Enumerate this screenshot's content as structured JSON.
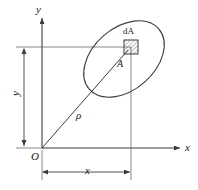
{
  "figure": {
    "type": "engineering-diagram",
    "background_color": "#ffffff",
    "line_color": "#3c3c3c",
    "text_color": "#1a1a1a",
    "labels": {
      "y_axis": "y",
      "x_axis": "x",
      "origin": "O",
      "rho": "ρ",
      "area": "A",
      "element_prefix": "d",
      "element_suffix": "A",
      "element_full": "dA",
      "x_dimension": "x",
      "y_dimension": "y"
    },
    "geometry": {
      "origin_px": [
        42,
        148
      ],
      "y_axis_top_px": [
        42,
        16
      ],
      "x_axis_right_px": [
        182,
        148
      ],
      "element_center_px": [
        131,
        47
      ],
      "element_size_px": 14,
      "ellipse_center_px": [
        124,
        59
      ],
      "ellipse_rx_px": 46,
      "ellipse_ry_px": 31,
      "ellipse_rotation_deg": -41,
      "x_dim_line_y_px": 172,
      "x_dim_from_px": 42,
      "x_dim_to_px": 131,
      "y_dim_line_x_px": 24,
      "y_dim_from_px": 47,
      "y_dim_to_px": 148
    },
    "hatch": {
      "pattern": "diagonal-45",
      "spacing_px": 3,
      "color": "#555555"
    }
  }
}
